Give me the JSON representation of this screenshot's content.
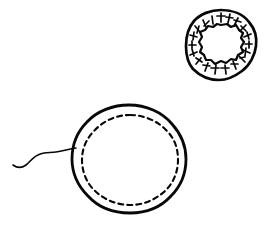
{
  "figure": {
    "title": "Hand-drawn biological line illustration",
    "background_color": "#ffffff",
    "ink_color": "#080808",
    "width": 271,
    "height": 226,
    "style": "pen-and-ink line drawing, no labels or text",
    "objects": [
      {
        "id": "flagellated-cell",
        "name": "Large round cell with dashed inner membrane and flagellum",
        "center_x": 129,
        "center_y": 159,
        "radius_x": 57,
        "radius_y": 54,
        "outline_style": "solid irregular hand-drawn circle",
        "outline_stroke_width": 2.6,
        "inner_circle": {
          "name": "Dashed inner membrane",
          "center_x": 130,
          "center_y": 160,
          "radius_x": 48,
          "radius_y": 45,
          "style": "dashed",
          "dash_length": 5,
          "dash_gap": 4,
          "stroke_width": 2.1
        },
        "appendage": {
          "name": "Flagellum tail",
          "style": "thin wavy line",
          "stroke_width": 1.5,
          "start_x": 13,
          "start_y": 164,
          "end_x": 76,
          "end_y": 148,
          "direction": "extends left from cell"
        }
      },
      {
        "id": "ring-cross-section",
        "name": "Small annular cross-section with irregular lumen and radial tick marks",
        "center_x": 221,
        "center_y": 45,
        "outer_radius_x": 35,
        "outer_radius_y": 35,
        "inner_radius_x": 21,
        "inner_radius_y": 20,
        "outline_stroke_width": 2.6,
        "inner_boundary_style": "irregular jagged hand-drawn outline",
        "inner_boundary_stroke_width": 2.2,
        "lumen_fill": "#ffffff",
        "tick_marks": {
          "name": "Radial hash marks in the annular band",
          "count": 24,
          "shape": "short T-shaped / cross-like strokes pointing inward",
          "stroke_width": 1.6
        }
      }
    ]
  }
}
